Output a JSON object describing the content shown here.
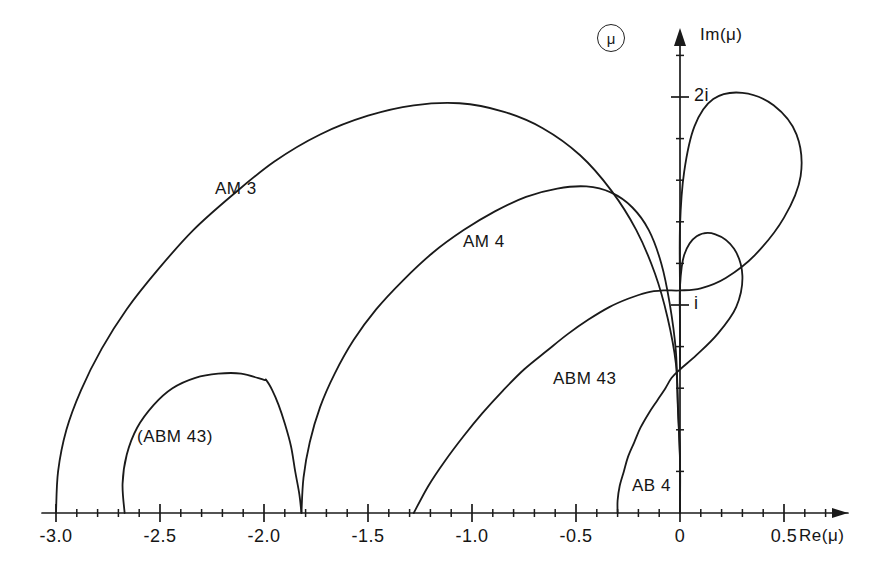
{
  "figure": {
    "badge": "μ",
    "axes": {
      "x_label": "Re(μ)",
      "y_label": "Im(μ)",
      "x_ticks_major": [
        {
          "value": -3.0,
          "label": "-3.0"
        },
        {
          "value": -2.5,
          "label": "-2.5"
        },
        {
          "value": -2.0,
          "label": "-2.0"
        },
        {
          "value": -1.5,
          "label": "-1.5"
        },
        {
          "value": -1.0,
          "label": "-1.0"
        },
        {
          "value": -0.5,
          "label": "-0.5"
        },
        {
          "value": 0.0,
          "label": "0"
        },
        {
          "value": 0.5,
          "label": "0.5"
        }
      ],
      "x_minor_step": 0.1,
      "x_range": [
        -3.25,
        0.95
      ],
      "y_ticks_major": [
        {
          "value": 1.0,
          "label": "i"
        },
        {
          "value": 2.0,
          "label": "2i"
        }
      ],
      "y_minor_step": 0.2,
      "y_range": [
        -0.35,
        2.55
      ],
      "grid": "off",
      "origin_px": [
        680,
        513
      ],
      "unit_px": 208
    },
    "curve_labels": [
      {
        "name": "AM 3",
        "x_px": 215,
        "y_px": 179
      },
      {
        "name": "AM 4",
        "x_px": 463,
        "y_px": 232
      },
      {
        "name": "ABM 43",
        "x_px": 553,
        "y_px": 369
      },
      {
        "name": "(ABM 43)",
        "x_px": 137,
        "y_px": 427
      },
      {
        "name": "AB 4",
        "x_px": 632,
        "y_px": 476
      }
    ]
  },
  "chart_data": {
    "type": "line",
    "title": "",
    "xlabel": "Re(μ)",
    "ylabel": "Im(μ)",
    "xlim": [
      -3.25,
      0.95
    ],
    "ylim": [
      -0.35,
      2.55
    ],
    "grid": false,
    "legend": "inline-annotations",
    "series": [
      {
        "name": "AM 3",
        "real_axis_crossings": [
          -3.0,
          0.0
        ],
        "peak": {
          "re": -1.11,
          "im": 1.97
        },
        "points": [
          [
            -3.0,
            0.0
          ],
          [
            -2.99,
            0.2
          ],
          [
            -2.95,
            0.4
          ],
          [
            -2.88,
            0.59
          ],
          [
            -2.78,
            0.79
          ],
          [
            -2.66,
            0.98
          ],
          [
            -2.51,
            1.17
          ],
          [
            -2.34,
            1.36
          ],
          [
            -2.15,
            1.53
          ],
          [
            -1.95,
            1.69
          ],
          [
            -1.73,
            1.82
          ],
          [
            -1.5,
            1.91
          ],
          [
            -1.28,
            1.96
          ],
          [
            -1.06,
            1.97
          ],
          [
            -0.85,
            1.93
          ],
          [
            -0.66,
            1.85
          ],
          [
            -0.48,
            1.72
          ],
          [
            -0.33,
            1.55
          ],
          [
            -0.21,
            1.36
          ],
          [
            -0.12,
            1.15
          ],
          [
            -0.06,
            0.94
          ],
          [
            -0.02,
            0.72
          ],
          [
            -0.01,
            0.5
          ],
          [
            0.0,
            0.25
          ],
          [
            0.0,
            0.0
          ]
        ]
      },
      {
        "name": "AM 4",
        "real_axis_crossings": [
          -1.82,
          0.0
        ],
        "peak": {
          "re": -0.56,
          "im": 1.57
        },
        "points": [
          [
            -1.82,
            0.0
          ],
          [
            -1.81,
            0.17
          ],
          [
            -1.78,
            0.34
          ],
          [
            -1.73,
            0.51
          ],
          [
            -1.66,
            0.67
          ],
          [
            -1.57,
            0.83
          ],
          [
            -1.46,
            0.98
          ],
          [
            -1.33,
            1.12
          ],
          [
            -1.19,
            1.25
          ],
          [
            -1.04,
            1.36
          ],
          [
            -0.89,
            1.45
          ],
          [
            -0.74,
            1.52
          ],
          [
            -0.59,
            1.56
          ],
          [
            -0.45,
            1.57
          ],
          [
            -0.33,
            1.54
          ],
          [
            -0.23,
            1.47
          ],
          [
            -0.15,
            1.36
          ],
          [
            -0.09,
            1.2
          ],
          [
            -0.05,
            1.01
          ],
          [
            -0.02,
            0.78
          ],
          [
            -0.01,
            0.52
          ],
          [
            0.0,
            0.26
          ],
          [
            0.0,
            0.0
          ]
        ]
      },
      {
        "name": "ABM 43",
        "real_axis_crossings": [
          -1.28,
          0.0
        ],
        "note": "cusp at -1.28 on the real axis, rises monotonically to the imaginary axis near i and continues into a right-hand loop",
        "points": [
          [
            -1.28,
            0.0
          ],
          [
            -1.21,
            0.13
          ],
          [
            -1.13,
            0.25
          ],
          [
            -1.04,
            0.37
          ],
          [
            -0.95,
            0.48
          ],
          [
            -0.85,
            0.59
          ],
          [
            -0.75,
            0.69
          ],
          [
            -0.64,
            0.78
          ],
          [
            -0.54,
            0.86
          ],
          [
            -0.44,
            0.93
          ],
          [
            -0.34,
            0.99
          ],
          [
            -0.25,
            1.03
          ],
          [
            -0.16,
            1.06
          ],
          [
            -0.08,
            1.07
          ],
          [
            0.0,
            1.07
          ],
          [
            0.1,
            1.08
          ],
          [
            0.22,
            1.13
          ],
          [
            0.36,
            1.24
          ],
          [
            0.5,
            1.42
          ],
          [
            0.58,
            1.62
          ],
          [
            0.56,
            1.82
          ],
          [
            0.45,
            1.96
          ],
          [
            0.3,
            2.02
          ],
          [
            0.16,
            1.99
          ],
          [
            0.07,
            1.86
          ],
          [
            0.02,
            1.64
          ],
          [
            0.0,
            1.38
          ],
          [
            0.0,
            1.07
          ]
        ]
      },
      {
        "name": "(ABM 43)",
        "real_axis_crossings": [
          -2.67,
          -1.82
        ],
        "peak": {
          "re": -2.13,
          "im": 0.67
        },
        "points": [
          [
            -2.67,
            0.0
          ],
          [
            -2.68,
            0.14
          ],
          [
            -2.66,
            0.28
          ],
          [
            -2.61,
            0.41
          ],
          [
            -2.53,
            0.52
          ],
          [
            -2.44,
            0.6
          ],
          [
            -2.33,
            0.65
          ],
          [
            -2.22,
            0.67
          ],
          [
            -2.11,
            0.67
          ],
          [
            -2.0,
            0.64
          ],
          [
            -1.99,
            0.64
          ],
          [
            -1.96,
            0.59
          ],
          [
            -1.93,
            0.52
          ],
          [
            -1.9,
            0.43
          ],
          [
            -1.87,
            0.32
          ],
          [
            -1.85,
            0.2
          ],
          [
            -1.83,
            0.09
          ],
          [
            -1.82,
            0.0
          ]
        ]
      },
      {
        "name": "AB 4",
        "real_axis_crossings": [
          -0.3,
          0.0
        ],
        "note": "rises from -0.30 on the real axis to the imaginary axis and closes into a lower right-hand loop",
        "points": [
          [
            -0.3,
            0.0
          ],
          [
            -0.3,
            0.06
          ],
          [
            -0.29,
            0.13
          ],
          [
            -0.27,
            0.2
          ],
          [
            -0.25,
            0.27
          ],
          [
            -0.22,
            0.34
          ],
          [
            -0.19,
            0.41
          ],
          [
            -0.15,
            0.48
          ],
          [
            -0.11,
            0.54
          ],
          [
            -0.07,
            0.6
          ],
          [
            -0.04,
            0.65
          ],
          [
            0.0,
            0.69
          ],
          [
            0.08,
            0.76
          ],
          [
            0.18,
            0.86
          ],
          [
            0.27,
            0.99
          ],
          [
            0.3,
            1.14
          ],
          [
            0.26,
            1.27
          ],
          [
            0.17,
            1.34
          ],
          [
            0.08,
            1.33
          ],
          [
            0.02,
            1.24
          ],
          [
            0.0,
            1.09
          ],
          [
            0.0,
            0.9
          ],
          [
            0.0,
            0.69
          ]
        ]
      }
    ]
  }
}
